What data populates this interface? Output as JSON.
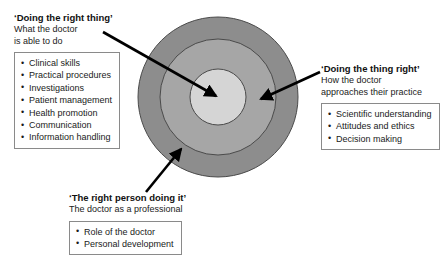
{
  "diagram": {
    "rings": {
      "center_x": 218,
      "center_y": 97,
      "outer_radius": 80,
      "middle_radius": 58,
      "inner_radius": 28,
      "outer_color": "#8d8d8d",
      "middle_color": "#a6a6a6",
      "inner_color": "#d5d5d5",
      "stroke_color": "#4a4a4a"
    },
    "arrow_color": "#000000",
    "annotations": [
      {
        "id": "doing-the-right-thing",
        "title": "‘Doing the right thing’",
        "subtitle_lines": [
          "What the doctor",
          "is able to do"
        ],
        "bullets": [
          "Clinical skills",
          "Practical procedures",
          "Investigations",
          "Patient management",
          "Health promotion",
          "Communication",
          "Information handling"
        ]
      },
      {
        "id": "doing-the-thing-right",
        "title": "‘Doing the thing right’",
        "subtitle_lines": [
          "How the doctor",
          "approaches their practice"
        ],
        "bullets": [
          "Scientific understanding",
          "Attitudes and ethics",
          "Decision making"
        ]
      },
      {
        "id": "the-right-person-doing-it",
        "title": "‘The right person doing it’",
        "subtitle_lines": [
          "The doctor as a professional"
        ],
        "bullets": [
          "Role of the doctor",
          "Personal development"
        ]
      }
    ]
  }
}
